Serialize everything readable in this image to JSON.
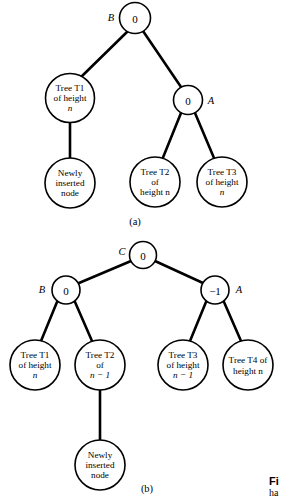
{
  "figure": {
    "part_a_label": "(a)",
    "part_b_label": "(b)",
    "caption_line1": "Fi",
    "caption_line2": "ha",
    "ink_color": "#000000",
    "background_color": "#ffffff"
  },
  "diagram_a": {
    "nodes": {
      "root": {
        "value": "0",
        "side_label": "B"
      },
      "left_child": {
        "line1": "Tree T1",
        "line2": "of height",
        "line3": "n"
      },
      "right_child": {
        "value": "0",
        "side_label": "A"
      },
      "left_grandchild": {
        "line1": "Newly",
        "line2": "inserted",
        "line3": "node"
      },
      "right_left_grandchild": {
        "line1": "Tree T2",
        "line2": "of",
        "line3": "height n"
      },
      "right_right_grandchild": {
        "line1": "Tree T3",
        "line2": "of height",
        "line3": "n"
      }
    }
  },
  "diagram_b": {
    "nodes": {
      "root": {
        "value": "0",
        "side_label": "C"
      },
      "left_child": {
        "value": "0",
        "side_label": "B"
      },
      "right_child": {
        "value": "−1",
        "side_label": "A"
      },
      "t1": {
        "line1": "Tree T1",
        "line2": "of height",
        "line3": "n"
      },
      "t2": {
        "line1": "Tree T2",
        "line2": "of",
        "line3": "n − 1"
      },
      "t3": {
        "line1": "Tree T3",
        "line2": "of height",
        "line3": "n − 1"
      },
      "t4": {
        "line1": "Tree T4 of",
        "line2": "height n",
        "line3": ""
      },
      "newly_inserted": {
        "line1": "Newly",
        "line2": "inserted",
        "line3": "node"
      }
    }
  }
}
